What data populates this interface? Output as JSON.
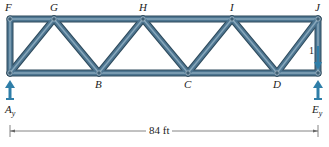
{
  "diagram": {
    "type": "truss",
    "colors": {
      "member": "#4d7590",
      "member_highlight": "#9fbccd",
      "member_edge": "#2e4a5c",
      "arrow": "#2f7ea8",
      "text": "#222222",
      "dimension_line": "#555555"
    },
    "nodes": {
      "F": {
        "label": "F",
        "x": 10,
        "y": 19
      },
      "G": {
        "label": "G",
        "x": 54,
        "y": 19
      },
      "H": {
        "label": "H",
        "x": 143,
        "y": 19
      },
      "I": {
        "label": "I",
        "x": 232,
        "y": 19
      },
      "J": {
        "label": "J",
        "x": 318,
        "y": 19
      },
      "A": {
        "label": "A",
        "x": 10,
        "y": 73
      },
      "B": {
        "label": "B",
        "x": 99,
        "y": 73
      },
      "C": {
        "label": "C",
        "x": 188,
        "y": 73
      },
      "D": {
        "label": "D",
        "x": 277,
        "y": 73
      },
      "E": {
        "label": "E",
        "x": 318,
        "y": 73
      }
    },
    "members": [
      [
        "F",
        "J"
      ],
      [
        "A",
        "E"
      ],
      [
        "F",
        "A"
      ],
      [
        "J",
        "E"
      ],
      [
        "A",
        "G"
      ],
      [
        "G",
        "B"
      ],
      [
        "B",
        "H"
      ],
      [
        "H",
        "C"
      ],
      [
        "C",
        "I"
      ],
      [
        "I",
        "D"
      ],
      [
        "D",
        "J"
      ]
    ],
    "labels": {
      "F": "F",
      "G": "G",
      "H": "H",
      "I": "I",
      "J": "J",
      "B": "B",
      "C": "C",
      "D": "D",
      "Ay_main": "A",
      "Ay_sub": "y",
      "Ey_main": "E",
      "Ey_sub": "y",
      "member_JE": "1"
    },
    "reactions": [
      {
        "name": "Ay",
        "node": "A",
        "direction": "up"
      },
      {
        "name": "Ey",
        "node": "E",
        "direction": "up"
      }
    ],
    "applied_load": {
      "node": "J",
      "direction": "down",
      "label": "1"
    },
    "dimension": {
      "label": "84 ft",
      "from": "A",
      "to": "E"
    }
  }
}
